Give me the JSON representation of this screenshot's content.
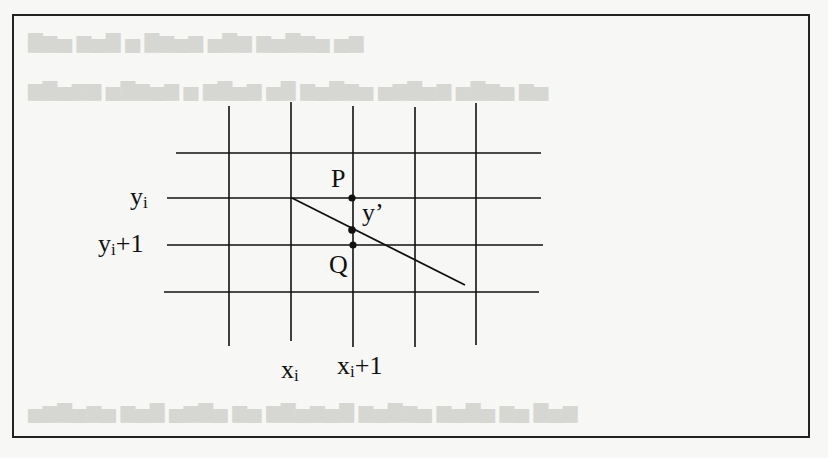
{
  "figure": {
    "labels": {
      "y_row": "y",
      "y_row_sub": "i",
      "y_next_row": "y",
      "y_next_row_sub": "i",
      "y_next_row_suffix": "+1",
      "x_col": "x",
      "x_col_sub": "i",
      "x_next_col": "x",
      "x_next_col_sub": "i",
      "x_next_col_suffix": "+1",
      "point_p": "P",
      "point_q": "Q",
      "point_y_prime": "y’"
    },
    "grid": {
      "horizontal_y": [
        153,
        198,
        245,
        292
      ],
      "vertical_x": [
        229,
        291,
        352,
        414,
        476
      ]
    },
    "line": {
      "x1": 292,
      "y1": 198,
      "x2": 465,
      "y2": 278
    },
    "points": [
      {
        "name": "P",
        "x": 352,
        "y": 198
      },
      {
        "name": "y'",
        "x": 352,
        "y": 230
      },
      {
        "name": "Q",
        "x": 353,
        "y": 245
      }
    ],
    "colors": {
      "ink": "#111111",
      "paper": "#f7f7f5",
      "bleed": "#d6d6d3"
    }
  }
}
